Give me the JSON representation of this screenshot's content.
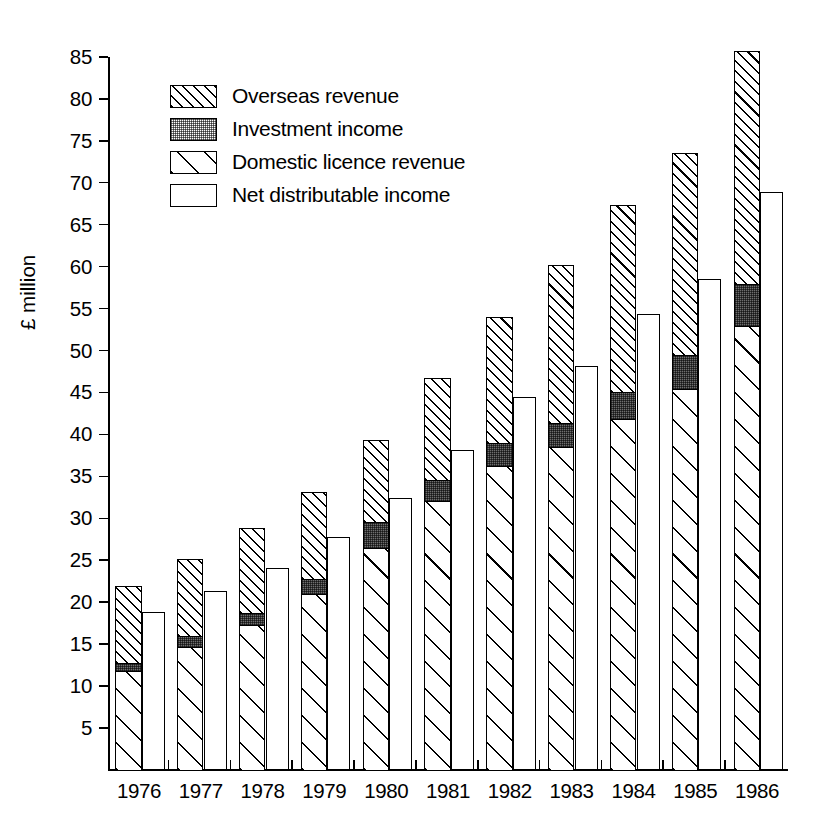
{
  "chart_data": {
    "type": "bar",
    "title": "",
    "subtitle": "",
    "xlabel": "",
    "ylabel": "£ million",
    "grid": false,
    "legend_position": "top-left",
    "ylim": [
      0,
      85
    ],
    "yticks": [
      5,
      10,
      15,
      20,
      25,
      30,
      35,
      40,
      45,
      50,
      55,
      60,
      65,
      70,
      75,
      80,
      85
    ],
    "ytick_labels": [
      "5",
      "10",
      "15",
      "20",
      "25",
      "30",
      "35",
      "40",
      "45",
      "50",
      "55",
      "60",
      "65",
      "70",
      "75",
      "80",
      "85"
    ],
    "categories": [
      "1976",
      "1977",
      "1978",
      "1979",
      "1980",
      "1981",
      "1982",
      "1983",
      "1984",
      "1985",
      "1986"
    ],
    "xtick_labels": [
      "1976",
      "1977",
      "1978",
      "1979",
      "1980",
      "1981",
      "1982",
      "1983",
      "1984",
      "1985",
      "1986"
    ],
    "series": [
      {
        "name": "Domestic licence revenue",
        "stack": "revenue",
        "values": [
          11.7,
          14.5,
          17.2,
          20.8,
          26.3,
          32.0,
          36.1,
          38.4,
          41.7,
          45.3,
          52.8
        ]
      },
      {
        "name": "Investment income",
        "stack": "revenue",
        "values": [
          0.9,
          1.3,
          1.4,
          1.9,
          3.1,
          2.5,
          2.7,
          2.8,
          3.2,
          4.1,
          5.0
        ]
      },
      {
        "name": "Overseas revenue",
        "stack": "revenue",
        "values": [
          9.1,
          9.2,
          10.0,
          10.3,
          9.8,
          12.0,
          15.0,
          18.8,
          22.2,
          23.9,
          27.7
        ]
      },
      {
        "name": "Net distributable income",
        "stack": "net",
        "values": [
          18.8,
          21.3,
          24.1,
          27.8,
          32.4,
          38.2,
          44.4,
          48.2,
          54.4,
          58.5,
          68.9
        ]
      }
    ],
    "stacked_totals": [
      21.7,
      25.0,
      28.6,
      33.0,
      39.2,
      46.5,
      53.8,
      60.0,
      67.1,
      73.3,
      85.5
    ],
    "segment_tops": {
      "domestic": [
        11.7,
        14.5,
        17.2,
        20.8,
        26.3,
        32.0,
        36.1,
        38.4,
        41.7,
        45.3,
        52.8
      ],
      "investment": [
        12.6,
        15.8,
        18.6,
        22.7,
        29.4,
        34.5,
        38.8,
        41.2,
        44.9,
        49.4,
        57.8
      ],
      "overseas": [
        21.7,
        25.0,
        28.6,
        33.0,
        39.2,
        46.5,
        53.8,
        60.0,
        67.1,
        73.3,
        85.5
      ]
    }
  },
  "legend": {
    "items": [
      {
        "label": "Overseas revenue",
        "pattern": "dense-diagonal-hatch"
      },
      {
        "label": "Investment income",
        "pattern": "dark-stipple"
      },
      {
        "label": "Domestic licence revenue",
        "pattern": "wide-diagonal-hatch"
      },
      {
        "label": "Net distributable income",
        "pattern": "solid-white"
      }
    ]
  },
  "axes": {
    "y_axis_title": "£ million",
    "y_tick_labels": [
      "85",
      "80",
      "75",
      "70",
      "65",
      "60",
      "55",
      "50",
      "45",
      "40",
      "35",
      "30",
      "25",
      "20",
      "15",
      "10",
      "5"
    ],
    "x_tick_labels": [
      "1976",
      "1977",
      "1978",
      "1979",
      "1980",
      "1981",
      "1982",
      "1983",
      "1984",
      "1985",
      "1986"
    ]
  }
}
